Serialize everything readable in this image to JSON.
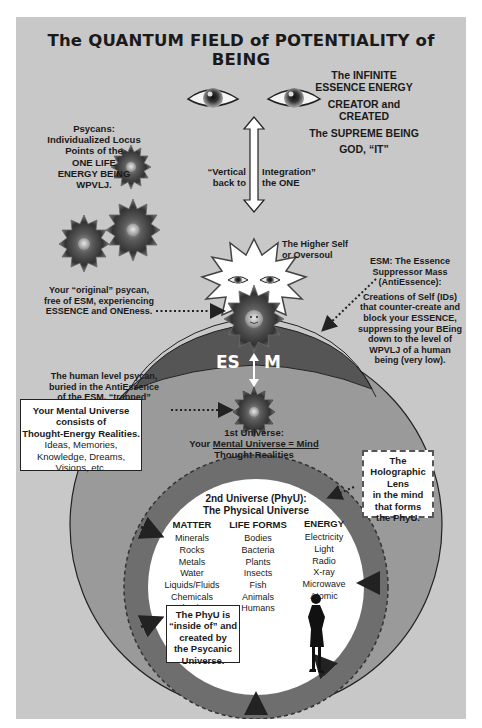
{
  "title": "The QUANTUM FIELD of POTENTIALITY of BEING",
  "top_right": {
    "line1": "The INFINITE",
    "line2": "ESSENCE ENERGY",
    "line3": "CREATOR and",
    "line4": "CREATED",
    "line5": "The SUPREME BEING",
    "line6": "GOD, “IT”"
  },
  "psycans": {
    "line1": "Psycans:",
    "line2": "Individualized Locus",
    "line3": "Points of the",
    "line4": "ONE LIFE",
    "line5": "ENERGY BEING",
    "line6": "WPVLJ."
  },
  "vertical_integration": {
    "left1": "“Vertical",
    "left2": "back to",
    "right1": "Integration”",
    "right2": "the ONE"
  },
  "higher_self": {
    "line1": "The Higher Self",
    "line2": "or Oversoul"
  },
  "original_psycan": {
    "line1": "Your “original” psycan,",
    "line2": "free of ESM, experiencing",
    "line3": "ESSENCE and ONEness."
  },
  "esm_description": {
    "h1": "ESM: The Essence",
    "h2": "Suppressor Mass",
    "h3": "(AntiEssence):",
    "b1": "Creations of Self (IDs)",
    "b2": "that counter-create and",
    "b3": "block your ESSENCE,",
    "b4": "suppressing your BEing",
    "b5": "down to the level of",
    "b6": "WPVLJ of a human",
    "b7": "being (very low)."
  },
  "esm_dome": {
    "left": "ES",
    "right": "M"
  },
  "human_psycan": {
    "line1": "The human level psycan,",
    "line2": "buried in the AntiEssence",
    "line3": "of the ESM, “trapped”",
    "line4": "in mind."
  },
  "mental_universe_box": {
    "line1": "Your Mental Universe",
    "line2": "consists of",
    "line3": "Thought-Energy Realities.",
    "line4": "Ideas, Memories,",
    "line5": "Knowledge, Dreams,",
    "line6": "Visions, etc."
  },
  "first_universe": {
    "line1": "1st Universe:",
    "line2_prefix": "Your ",
    "line2_underlined": "Mental Universe = Mind",
    "line3": "Thought Realities"
  },
  "holographic_lens": {
    "line1": "The",
    "line2": "Holographic",
    "line3": "Lens",
    "line4": "in the mind",
    "line5": "that forms",
    "line6": "the PhyU."
  },
  "second_universe": {
    "line1": "2nd Universe (PhyU):",
    "line2": "The Physical Universe"
  },
  "columns": [
    {
      "header": "MATTER",
      "items": [
        "Minerals",
        "Rocks",
        "Metals",
        "Water",
        "Liquids/Fluids",
        "Chemicals",
        "Plastics"
      ]
    },
    {
      "header": "LIFE FORMS",
      "items": [
        "Bodies",
        "Bacteria",
        "Plants",
        "Insects",
        "Fish",
        "Animals",
        "Humans"
      ]
    },
    {
      "header": "ENERGY",
      "items": [
        "Electricity",
        "Light",
        "Radio",
        "X-ray",
        "Microwave",
        "Atomic"
      ]
    }
  ],
  "phyu_box": {
    "line1": "The PhyU is",
    "line2": "“inside of” and",
    "line3": "created by",
    "line4": "the Psycanic",
    "line5": "Universe."
  },
  "colors": {
    "panel": "#c8c8c8",
    "mental_circle": "#9a9a9a",
    "phyu_ring": "#6e6e6e",
    "esm_dome": "#5a5a5a",
    "inner_circle": "#ffffff"
  }
}
